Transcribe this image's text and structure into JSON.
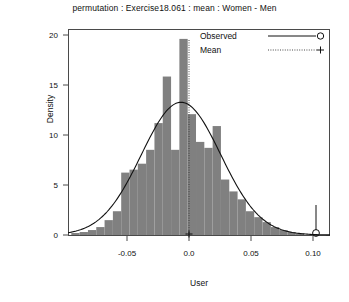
{
  "title": "permutation : Exercise18.061 : mean : Women - Men",
  "axes": {
    "xlabel": "User",
    "ylabel": "Density",
    "xticks": [
      "-0.05",
      "0.0",
      "0.05",
      "0.10"
    ],
    "yticks": [
      "0",
      "5",
      "10",
      "15",
      "20"
    ]
  },
  "legend": {
    "items": [
      {
        "label": "Observed",
        "marker": "open-circle",
        "line": "solid"
      },
      {
        "label": "Mean",
        "marker": "plus",
        "line": "dotted"
      }
    ]
  },
  "colors": {
    "bar_fill": "#808080",
    "frame": "#4a4a4a",
    "curve": "#111111",
    "text": "#111111"
  },
  "chart_data": {
    "type": "bar",
    "title": "permutation : Exercise18.061 : mean : Women - Men",
    "xlabel": "User",
    "ylabel": "Density",
    "xlim": [
      -0.085,
      0.112
    ],
    "ylim": [
      0,
      20.8
    ],
    "grid": false,
    "legend_position": "top-right",
    "bin_width": 0.00625,
    "bin_left_edges": [
      -0.0825,
      -0.07625,
      -0.07,
      -0.06375,
      -0.0575,
      -0.05125,
      -0.045,
      -0.03875,
      -0.0325,
      -0.02625,
      -0.02,
      -0.01375,
      -0.0075,
      -0.00125,
      0.005,
      0.01125,
      0.0175,
      0.02375,
      0.03,
      0.03625,
      0.0425,
      0.04875,
      0.055,
      0.06125,
      0.0675,
      0.07375,
      0.08,
      0.08625
    ],
    "values": [
      0.2,
      0.3,
      0.5,
      0.8,
      1.5,
      2.4,
      6.3,
      6.6,
      7.2,
      8.6,
      11.3,
      16.0,
      8.6,
      19.8,
      12.2,
      9.4,
      8.8,
      11.0,
      5.6,
      4.4,
      3.6,
      2.4,
      1.8,
      1.3,
      0.8,
      0.5,
      0.3,
      0.15
    ],
    "series": [
      {
        "name": "Density (histogram)",
        "type": "bar",
        "values": [
          0.2,
          0.3,
          0.5,
          0.8,
          1.5,
          2.4,
          6.3,
          6.6,
          7.2,
          8.6,
          11.3,
          16.0,
          8.6,
          19.8,
          12.2,
          9.4,
          8.8,
          11.0,
          5.6,
          4.4,
          3.6,
          2.4,
          1.8,
          1.3,
          0.8,
          0.5,
          0.3,
          0.15
        ]
      },
      {
        "name": "Normal density curve",
        "type": "line",
        "mean": 0.0,
        "sd": 0.0298,
        "peak": 13.4
      }
    ],
    "annotations": [
      {
        "name": "mean-line",
        "x": 0.0,
        "style": "dotted-vertical",
        "marker": "plus",
        "label": "Mean"
      },
      {
        "name": "observed-value",
        "x": 0.105,
        "style": "solid-vertical",
        "marker": "open-circle",
        "label": "Observed"
      }
    ]
  }
}
